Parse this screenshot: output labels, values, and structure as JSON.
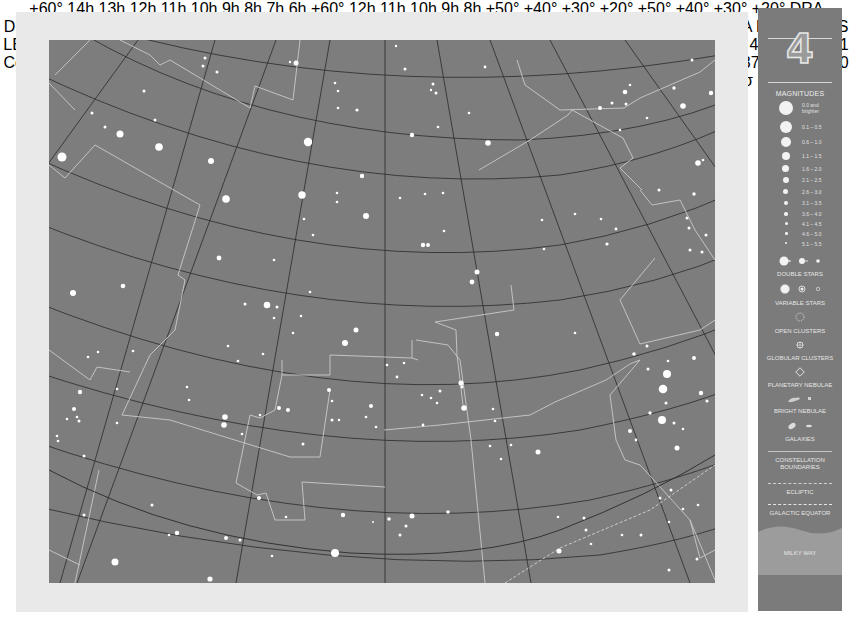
{
  "chart_id": "4",
  "grid": {
    "ra_labels_top": [
      "+60°",
      "14h",
      "13h",
      "12h",
      "11h",
      "10h",
      "9h",
      "8h",
      "7h",
      "6h",
      "+60°"
    ],
    "ra_labels_bottom": [
      "12h",
      "11h",
      "10h",
      "9h",
      "8h"
    ],
    "dec_labels_left": [
      "+50°",
      "+40°",
      "+30°",
      "+20°"
    ],
    "dec_labels_right": [
      "+50°",
      "+40°",
      "+30°",
      "+20°"
    ]
  },
  "constellations": [
    {
      "abbr": "DRA"
    },
    {
      "name": "DRACO"
    },
    {
      "abbr": "BOO"
    },
    {
      "name": "CAMELOPARDALIS"
    },
    {
      "name": "URSA MAJOR"
    },
    {
      "name": "CANES VENATICI"
    },
    {
      "name": "AURIGA"
    },
    {
      "name": "LYNX"
    },
    {
      "name": "LEO MINOR"
    },
    {
      "name": "COMA BERENICES"
    },
    {
      "name": "LEO"
    },
    {
      "name": "CANCER"
    },
    {
      "name": "GEMINI"
    },
    {
      "abbr": "VIR"
    },
    {
      "abbr": "CMI"
    }
  ],
  "labels": {
    "dra": "DRA",
    "draco": "DRACO",
    "boo": "BOO",
    "camelopardalis": "CAMELOPARDALIS",
    "ursa_major": "URSA MAJOR",
    "canes_venatici": "CANES VENATICI",
    "auriga": "AURIGA",
    "lynx": "LYNX",
    "leo_minor": "LEO MINOR",
    "coma_1": "COMA",
    "coma_2": "BERENICES",
    "leo": "LEO",
    "cancer": "CANCER",
    "gemini": "GEMINI",
    "vir": "VIR",
    "cmi": "CMI"
  },
  "deep_sky": {
    "m101": "M101",
    "m51": "M51",
    "m63": "M63",
    "m94": "M94",
    "m106": "M106",
    "n4449": "4449",
    "m109": "M109",
    "m108": "M108",
    "m97": "M97",
    "m82": "M82",
    "m81": "M81",
    "n2403": "2403",
    "n4631": "4631",
    "n4565": "4565",
    "mel111_1": "Mel. 111",
    "mel111_2": "Coma Star",
    "mel111_3": "Cluster",
    "m98": "M98",
    "n2903": "2903",
    "m44": "M44",
    "praesepe": "Praesepe",
    "n2281": "2281"
  },
  "stars": {
    "castor": "Castor",
    "pollux": "Pollux",
    "ten_umi": "10 UMa",
    "tu": "TU",
    "y": "Y",
    "n80": "80",
    "n23": "23",
    "n26": "26",
    "n15": "15",
    "n21": "21",
    "n31": "31",
    "n46": "46",
    "n30": "30",
    "n37": "37",
    "n42": "42",
    "n54": "54",
    "n53": "53",
    "n60": "60",
    "n12a": "12",
    "n10": "10",
    "n57": "57",
    "n17": "17",
    "n1715": "17,15",
    "n2": "2",
    "n5": "5",
    "n12": "12",
    "n13": "13"
  },
  "legend": {
    "title": "MAGNITUDES",
    "magnitudes": [
      {
        "label": "0.0 and brighter",
        "size": 18
      },
      {
        "label": "0.1 – 0.5",
        "size": 15
      },
      {
        "label": "0.6 – 1.0",
        "size": 13
      },
      {
        "label": "1.1 – 1.5",
        "size": 11
      },
      {
        "label": "1.6 – 2.0",
        "size": 9
      },
      {
        "label": "2.1 – 2.5",
        "size": 8
      },
      {
        "label": "2.6 – 3.0",
        "size": 7
      },
      {
        "label": "3.1 – 3.5",
        "size": 6
      },
      {
        "label": "3.6 – 4.0",
        "size": 5
      },
      {
        "label": "4.1 – 4.5",
        "size": 4
      },
      {
        "label": "4.6 – 5.0",
        "size": 3
      },
      {
        "label": "5.1 – 5.5",
        "size": 2
      }
    ],
    "double_stars": "DOUBLE STARS",
    "variable_stars": "VARIABLE STARS",
    "open_clusters": "OPEN CLUSTERS",
    "globular_clusters": "GLOBULAR CLUSTERS",
    "planetary_nebulae": "PLANETARY NEBULAE",
    "bright_nebulae": "BRIGHT NEBULAE",
    "galaxies": "GALAXIES",
    "constellation_boundaries_1": "CONSTELLATION",
    "constellation_boundaries_2": "BOUNDARIES",
    "ecliptic": "ECLIPTIC",
    "galactic_equator": "GALACTIC EQUATOR",
    "milky_way": "MILKY WAY"
  },
  "credit": "Wil Tirion",
  "colors": {
    "sky": "#7d7d7d",
    "frame": "#e9e9e9",
    "sidebar": "#7b7b7b",
    "star": "#ffffff",
    "boundary": "#c9c9c9",
    "grid": "#2a2a2a",
    "label": "#2e2e2e"
  }
}
